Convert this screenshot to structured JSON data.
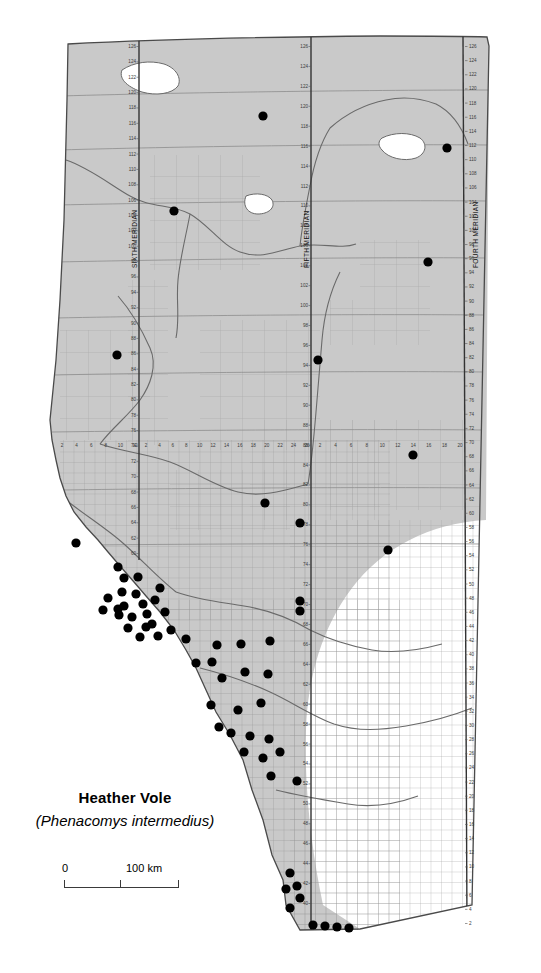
{
  "map": {
    "title": "Heather Vole",
    "scientific_name": "(Phenacomys intermedius)",
    "region": "Alberta",
    "type": "species-distribution-map",
    "colors": {
      "forest_fill": "#c9c9c9",
      "prairie_fill": "#ffffff",
      "grid_line": "#9a9a9a",
      "fine_grid_line": "#a8a8a8",
      "outline": "#4a4a4a",
      "river": "#5a5a5a",
      "occurrence_dot": "#000000"
    },
    "scale_bar": {
      "zero_label": "0",
      "max_label": "100 km",
      "ticks": 2
    },
    "meridians": [
      {
        "name": "SIXTH MERIDIAN",
        "x": 139
      },
      {
        "name": "FIFTH MERIDIAN",
        "x": 311
      },
      {
        "name": "FOURTH MERIDIAN",
        "x": 463
      }
    ],
    "township_labels_sixth": [
      126,
      124,
      122,
      120,
      118,
      116,
      114,
      112,
      110,
      108,
      106,
      104,
      102,
      100,
      98,
      96,
      94,
      92,
      90,
      88,
      86,
      84,
      82,
      80,
      78,
      76,
      74,
      72,
      70,
      68,
      66,
      64,
      62,
      60
    ],
    "township_labels_fifth": [
      126,
      124,
      122,
      120,
      118,
      116,
      114,
      112,
      110,
      108,
      106,
      104,
      102,
      100,
      98,
      96,
      94,
      92,
      90,
      88,
      86,
      84,
      82,
      80,
      78,
      76,
      74,
      72,
      70,
      68,
      66,
      64,
      62,
      60,
      58,
      56,
      54,
      52,
      50,
      48,
      46,
      44,
      42,
      40
    ],
    "township_labels_fourth": [
      126,
      124,
      122,
      120,
      118,
      116,
      114,
      112,
      110,
      108,
      106,
      104,
      102,
      100,
      98,
      96,
      94,
      92,
      90,
      88,
      86,
      84,
      82,
      80,
      78,
      76,
      74,
      72,
      70,
      68,
      66,
      64,
      62,
      60,
      58,
      56,
      54,
      52,
      50,
      48,
      46,
      44,
      42,
      40,
      38,
      36,
      34,
      32,
      30,
      28,
      26,
      24,
      22,
      20,
      18,
      16,
      14,
      12,
      10,
      8,
      6,
      4,
      2
    ],
    "range_labels_west_of_sixth": [
      12,
      10,
      8,
      6,
      4,
      2
    ],
    "range_labels_west_of_fifth": [
      26,
      24,
      22,
      20,
      18,
      16,
      14,
      12,
      10,
      8,
      6,
      4,
      2
    ],
    "range_labels_west_of_fourth": [
      20,
      18,
      16,
      14,
      12,
      10,
      8,
      6,
      4,
      2
    ],
    "occurrence_points": [
      {
        "x": 263,
        "y": 116
      },
      {
        "x": 447,
        "y": 148
      },
      {
        "x": 174,
        "y": 211
      },
      {
        "x": 428,
        "y": 262
      },
      {
        "x": 117,
        "y": 355
      },
      {
        "x": 318,
        "y": 360
      },
      {
        "x": 413,
        "y": 455
      },
      {
        "x": 265,
        "y": 503
      },
      {
        "x": 300,
        "y": 523
      },
      {
        "x": 388,
        "y": 550
      },
      {
        "x": 76,
        "y": 543
      },
      {
        "x": 300,
        "y": 601
      },
      {
        "x": 300,
        "y": 611
      },
      {
        "x": 118,
        "y": 567
      },
      {
        "x": 124,
        "y": 578
      },
      {
        "x": 138,
        "y": 577
      },
      {
        "x": 122,
        "y": 592
      },
      {
        "x": 136,
        "y": 594
      },
      {
        "x": 108,
        "y": 598
      },
      {
        "x": 124,
        "y": 606
      },
      {
        "x": 143,
        "y": 604
      },
      {
        "x": 119,
        "y": 615
      },
      {
        "x": 132,
        "y": 617
      },
      {
        "x": 147,
        "y": 614
      },
      {
        "x": 128,
        "y": 628
      },
      {
        "x": 146,
        "y": 627
      },
      {
        "x": 118,
        "y": 609
      },
      {
        "x": 103,
        "y": 610
      },
      {
        "x": 155,
        "y": 600
      },
      {
        "x": 160,
        "y": 588
      },
      {
        "x": 165,
        "y": 612
      },
      {
        "x": 152,
        "y": 624
      },
      {
        "x": 140,
        "y": 637
      },
      {
        "x": 158,
        "y": 636
      },
      {
        "x": 171,
        "y": 630
      },
      {
        "x": 186,
        "y": 639
      },
      {
        "x": 217,
        "y": 645
      },
      {
        "x": 241,
        "y": 644
      },
      {
        "x": 270,
        "y": 641
      },
      {
        "x": 196,
        "y": 663
      },
      {
        "x": 212,
        "y": 662
      },
      {
        "x": 222,
        "y": 678
      },
      {
        "x": 245,
        "y": 672
      },
      {
        "x": 268,
        "y": 674
      },
      {
        "x": 211,
        "y": 705
      },
      {
        "x": 238,
        "y": 710
      },
      {
        "x": 261,
        "y": 703
      },
      {
        "x": 219,
        "y": 727
      },
      {
        "x": 231,
        "y": 733
      },
      {
        "x": 250,
        "y": 736
      },
      {
        "x": 269,
        "y": 739
      },
      {
        "x": 244,
        "y": 752
      },
      {
        "x": 263,
        "y": 758
      },
      {
        "x": 280,
        "y": 752
      },
      {
        "x": 271,
        "y": 776
      },
      {
        "x": 297,
        "y": 781
      },
      {
        "x": 290,
        "y": 873
      },
      {
        "x": 297,
        "y": 886
      },
      {
        "x": 300,
        "y": 898
      },
      {
        "x": 286,
        "y": 889
      },
      {
        "x": 290,
        "y": 908
      },
      {
        "x": 313,
        "y": 925
      },
      {
        "x": 325,
        "y": 926
      },
      {
        "x": 337,
        "y": 927
      },
      {
        "x": 349,
        "y": 928
      }
    ]
  }
}
